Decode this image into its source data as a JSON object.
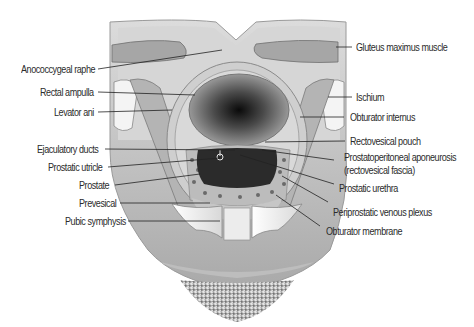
{
  "figure": {
    "colors": {
      "background": "#ffffff",
      "tissue": "#c9c9c9",
      "tissue_light": "#dedede",
      "muscle": "#9a9a9a",
      "lumen_dark": "#1a1a1a",
      "prostate": "#2a2a2a",
      "bone": "#f2f2f2",
      "leader_line": "#222222"
    }
  },
  "labels": {
    "left": [
      {
        "id": "anococcygeal-raphe",
        "text": "Anococcygeal raphe"
      },
      {
        "id": "rectal-ampulla",
        "text": "Rectal ampulla"
      },
      {
        "id": "levator-ani",
        "text": "Levator ani"
      },
      {
        "id": "ejaculatory-ducts",
        "text": "Ejaculatory ducts"
      },
      {
        "id": "prostatic-utricle",
        "text": "Prostatic utricle"
      },
      {
        "id": "prostate",
        "text": "Prostate"
      },
      {
        "id": "prevesical",
        "text": "Prevesical"
      },
      {
        "id": "pubic-symphysis",
        "text": "Pubic symphysis"
      }
    ],
    "right": [
      {
        "id": "gluteus-maximus",
        "text": "Gluteus maximus muscle"
      },
      {
        "id": "ischium",
        "text": "Ischium"
      },
      {
        "id": "obturator-internus",
        "text": "Obturator internus"
      },
      {
        "id": "rectovesical-pouch",
        "text": "Rectovesical pouch"
      },
      {
        "id": "prostatoperitoneal-aponeurosis",
        "text": "Prostatoperitoneal aponeurosis"
      },
      {
        "id": "rectovesical-fascia",
        "text": "(rectovesical fascia)"
      },
      {
        "id": "prostatic-urethra",
        "text": "Prostatic urethra"
      },
      {
        "id": "periprostatic-venous-plexus",
        "text": "Periprostatic venous plexus"
      },
      {
        "id": "obturator-membrane",
        "text": "Obturator membrane"
      }
    ]
  }
}
